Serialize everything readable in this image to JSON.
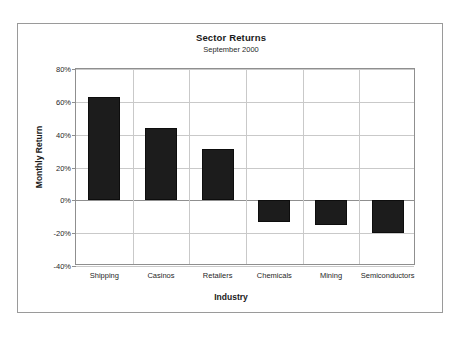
{
  "chart_data": {
    "type": "bar",
    "title": "Sector Returns",
    "subtitle": "September 2000",
    "xlabel": "Industry",
    "ylabel": "Monthly Return",
    "categories": [
      "Shipping",
      "Casinos",
      "Retailers",
      "Chemicals",
      "Mining",
      "Semiconductors"
    ],
    "values": [
      63,
      44,
      31,
      -13,
      -15,
      -20
    ],
    "ylim": [
      -40,
      80
    ],
    "ytick_labels": [
      "80%",
      "60%",
      "40%",
      "20%",
      "0%",
      "-20%",
      "-40%"
    ],
    "ytick_values": [
      80,
      60,
      40,
      20,
      0,
      -20,
      -40
    ],
    "grid": true,
    "legend": "none",
    "bar_color": "#1c1c1c",
    "grid_color": "#c9c9c9",
    "axis_color": "#8f8f8f",
    "plot_background": "#ffffff"
  }
}
